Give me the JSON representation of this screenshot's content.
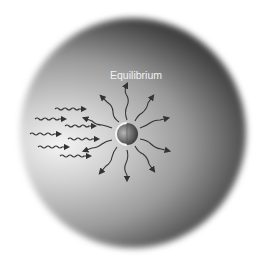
{
  "diagram": {
    "title": "Equilibrium",
    "elements": {
      "central_body": "planet-sphere",
      "incoming_radiation": "wavy-arrows-from-left",
      "outgoing_radiation": "wavy-arrows-radiating-outward"
    },
    "colors": {
      "background": "#ffffff",
      "globe_dark": "#1c1c1c",
      "globe_light": "#f4f4f4",
      "arrow": "#3a3a3a",
      "label": "#f2f2f2"
    }
  }
}
